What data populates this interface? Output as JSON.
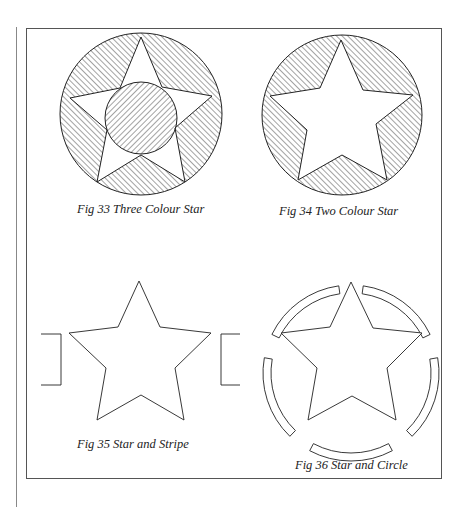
{
  "page": {
    "page_number": "",
    "colors": {
      "line": "#222222",
      "frame": "#555555",
      "background": "#ffffff"
    }
  },
  "figures": [
    {
      "id": "fig33",
      "caption": "Fig 33 Three Colour Star",
      "description": "Star on hatched circle with hatched centre disc"
    },
    {
      "id": "fig34",
      "caption": "Fig 34 Two Colour Star",
      "description": "White star on hatched circle"
    },
    {
      "id": "fig35",
      "caption": "Fig 35 Star and Stripe",
      "description": "Star outline with side stripe stubs"
    },
    {
      "id": "fig36",
      "caption": "Fig 36 Star and Circle",
      "description": "Star outline inside broken ring of five segments"
    }
  ]
}
